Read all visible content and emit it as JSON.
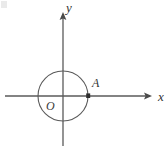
{
  "figure": {
    "title": "",
    "type": "coordinate-plane-with-circle",
    "background_color": "#ffffff",
    "stroke_color": "#555555",
    "axes": {
      "x": {
        "label": "x",
        "label_x": 158,
        "label_y": 101,
        "start_x": 5,
        "end_x": 152,
        "y": 96,
        "arrow": "right"
      },
      "y": {
        "label": "y",
        "label_x": 66,
        "label_y": 12,
        "top_y": 12,
        "bottom_y": 146,
        "x": 63,
        "arrow": "up"
      }
    },
    "origin": {
      "label": "O",
      "x": 63,
      "y": 96,
      "label_x": 46,
      "label_y": 110
    },
    "circle": {
      "center_x": 63,
      "center_y": 96,
      "radius": 25,
      "stroke_color": "#5a5a5a",
      "stroke_width": 1.1,
      "fill": "none"
    },
    "points": [
      {
        "name": "A",
        "label": "A",
        "x": 88,
        "y": 96,
        "label_x": 92,
        "label_y": 87,
        "marker": "filled-square"
      }
    ]
  }
}
